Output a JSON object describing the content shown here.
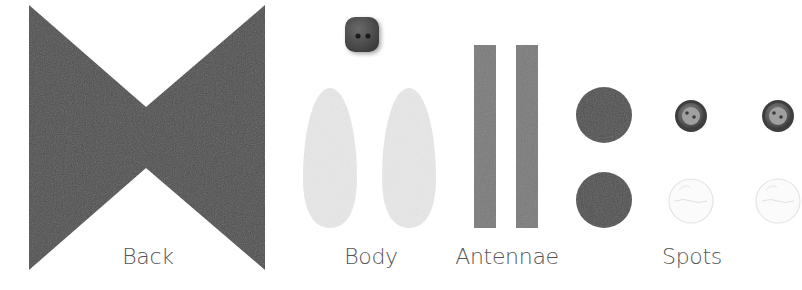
{
  "image": {
    "description": "Craft kit pieces laid out on white background",
    "background": "#ffffff"
  },
  "groups": [
    {
      "id": "back",
      "label": "Back",
      "label_pos": {
        "x": 148,
        "y": 246
      },
      "pieces": [
        {
          "shape": "bowtie",
          "color": "#505050",
          "bounds": {
            "x1": 29,
            "y1": 5,
            "x2": 265,
            "y2": 270
          },
          "waist": {
            "x": 146,
            "y_top": 107,
            "y_bot": 168
          }
        }
      ]
    },
    {
      "id": "body",
      "label": "Body",
      "label_pos": {
        "x": 371,
        "y": 246
      },
      "pieces": [
        {
          "shape": "button-square",
          "color": "#4a4a4a",
          "cx": 362,
          "cy": 34,
          "size": 36
        },
        {
          "shape": "oval",
          "color": "#e8e8e8",
          "cx": 330,
          "cy": 160,
          "rx": 27,
          "ry": 72
        },
        {
          "shape": "oval",
          "color": "#e8e8e8",
          "cx": 409,
          "cy": 160,
          "rx": 27,
          "ry": 72
        }
      ]
    },
    {
      "id": "antennae",
      "label": "Antennae",
      "label_pos": {
        "x": 507,
        "y": 246
      },
      "pieces": [
        {
          "shape": "strip",
          "color": "#7a7a7a",
          "x": 474,
          "y": 45,
          "w": 22,
          "h": 183
        },
        {
          "shape": "strip",
          "color": "#7a7a7a",
          "x": 516,
          "y": 45,
          "w": 22,
          "h": 183
        }
      ]
    },
    {
      "id": "spots",
      "label": "Spots",
      "label_pos": {
        "x": 692,
        "y": 246
      },
      "pieces": [
        {
          "shape": "felt-circle",
          "color": "#505050",
          "cx": 604,
          "cy": 115,
          "r": 28
        },
        {
          "shape": "felt-circle",
          "color": "#505050",
          "cx": 604,
          "cy": 200,
          "r": 28
        },
        {
          "shape": "shirt-button-dark",
          "color": "#6a6a6a",
          "cx": 691,
          "cy": 116,
          "r": 16
        },
        {
          "shape": "shirt-button-dark",
          "color": "#6a6a6a",
          "cx": 778,
          "cy": 116,
          "r": 16
        },
        {
          "shape": "shirt-button-clear",
          "color": "#eeeeee",
          "cx": 691,
          "cy": 201,
          "r": 22
        },
        {
          "shape": "shirt-button-clear",
          "color": "#eeeeee",
          "cx": 778,
          "cy": 201,
          "r": 22
        }
      ]
    }
  ]
}
